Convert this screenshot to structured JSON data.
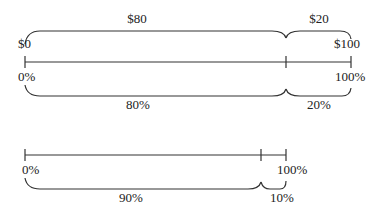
{
  "diagram": {
    "top_bar": {
      "start_dollar": "$0",
      "end_dollar": "$100",
      "start_percent": "0%",
      "end_percent": "100%",
      "upper_segments": [
        {
          "label": "$80"
        },
        {
          "label": "$20"
        }
      ],
      "lower_segments": [
        {
          "label": "80%"
        },
        {
          "label": "20%"
        }
      ]
    },
    "bottom_bar": {
      "start_percent": "0%",
      "end_percent": "100%",
      "lower_segments": [
        {
          "label": "90%"
        },
        {
          "label": "10%"
        }
      ]
    },
    "colors": {
      "line": "#333333",
      "text": "#222222",
      "background": "#ffffff"
    }
  }
}
